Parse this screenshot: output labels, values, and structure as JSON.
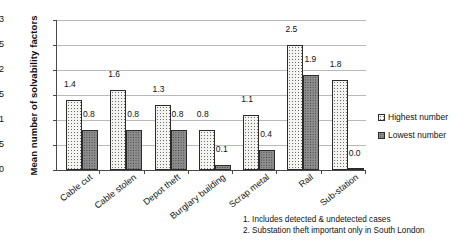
{
  "chart_data": {
    "type": "bar",
    "title": "",
    "xlabel": "",
    "ylabel": "Mean number of solvability factors",
    "ylim": [
      0,
      3
    ],
    "yticks": [
      "0",
      "0.5",
      "1",
      "1.5",
      "2",
      "2.5",
      "3"
    ],
    "grid": true,
    "legend_position": "right",
    "categories": [
      "Cable cut",
      "Cable stolen",
      "Depot theft",
      "Burglary building",
      "Scrap metal",
      "Rail",
      "Sub-station"
    ],
    "series": [
      {
        "name": "Highest number",
        "values": [
          1.4,
          1.6,
          1.3,
          0.8,
          1.1,
          2.5,
          1.8
        ],
        "labels": [
          "1.4",
          "1.6",
          "1.3",
          "0.8",
          "1.1",
          "2.5",
          "1.8"
        ]
      },
      {
        "name": "Lowest number",
        "values": [
          0.8,
          0.8,
          0.8,
          0.1,
          0.4,
          1.9,
          0.0
        ],
        "labels": [
          "0.8",
          "0.8",
          "0.8",
          "0.1",
          "0.4",
          "1.9",
          "0.0"
        ]
      }
    ],
    "annotations": [
      "1. Includes detected & undetected cases",
      "2. Substation theft important only in South London"
    ]
  }
}
